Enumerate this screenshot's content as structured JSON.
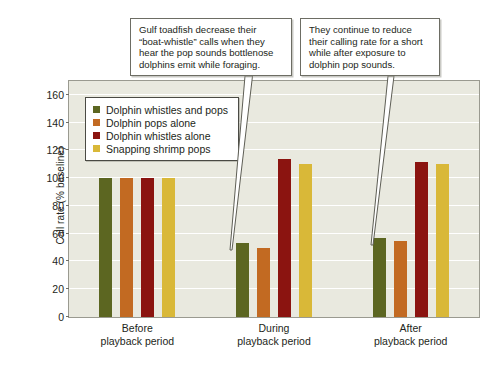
{
  "chart_data": {
    "type": "bar",
    "title": "",
    "subtitle": "",
    "xlabel": "",
    "ylabel": "Call rate (% baseline)",
    "ylim": [
      0,
      170
    ],
    "ytick_values": [
      0,
      20,
      40,
      60,
      80,
      100,
      120,
      140,
      160
    ],
    "ytick_labels": [
      "0",
      "20",
      "40",
      "60",
      "80",
      "100",
      "120",
      "140",
      "160"
    ],
    "grid": true,
    "grid_axis": "y",
    "legend_position": "upper-left-inside",
    "categories": [
      "Before\nplayback period",
      "During\nplayback period",
      "After\nplayback period"
    ],
    "category_labels": [
      {
        "line1": "Before",
        "line2": "playback period"
      },
      {
        "line1": "During",
        "line2": "playback period"
      },
      {
        "line1": "After",
        "line2": "playback period"
      }
    ],
    "series": [
      {
        "name": "Dolphin whistles and pops",
        "color": "#5c6621",
        "values": [
          100,
          53,
          57
        ]
      },
      {
        "name": "Dolphin pops alone",
        "color": "#c26a22",
        "values": [
          100,
          50,
          55
        ]
      },
      {
        "name": "Dolphin whistles alone",
        "color": "#8b1410",
        "values": [
          100,
          114,
          112
        ]
      },
      {
        "name": "Snapping shrimp pops",
        "color": "#d9b838",
        "values": [
          100,
          110,
          110
        ]
      }
    ],
    "annotations": [
      {
        "id": "callout-1",
        "text": "Gulf toadfish decrease their “boat-whistle” calls when they hear the pop sounds bottlenose dolphins emit while foraging.",
        "points_to": "During playback period — Dolphin whistles and pops bar"
      },
      {
        "id": "callout-2",
        "text": "They continue to reduce their calling rate for a short while after exposure to dolphin pop sounds.",
        "points_to": "After playback period — Dolphin whistles and pops bar"
      }
    ],
    "colors": {
      "plot_background": "#e9e9df",
      "gridline": "#ffffff",
      "axis_border": "#9a9a90",
      "text": "#231f20",
      "callout_border": "#6d6d64",
      "leader_line": "#5e5e55"
    }
  }
}
